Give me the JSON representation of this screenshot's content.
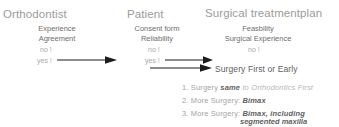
{
  "columns": [
    {
      "title": "Orthodontist",
      "criteria": "Experience\nAgreement",
      "answers": {
        "no": "no !",
        "yes": "yes !"
      }
    },
    {
      "title": "Patient",
      "criteria": "Consent form\nReliability",
      "answers": {
        "no": "no !",
        "yes": "yes !"
      }
    },
    {
      "title": "Surgical treatmentplan",
      "criteria": "Feasbility\nSurgical Experience",
      "answers": {
        "no": "no !"
      }
    }
  ],
  "outcome": "Surgery First or Early",
  "options": [
    {
      "number": "1.",
      "lead": "Surgery",
      "emphasis": "same",
      "tail": "to Orthodontics First"
    },
    {
      "number": "2.",
      "lead": "More Surgery:",
      "emphasis": "Bimax",
      "tail": ""
    },
    {
      "number": "3.",
      "lead": "More Surgery:",
      "emphasis": "Bimax, including",
      "emphasis2": "segmented maxilla",
      "tail": ""
    }
  ],
  "icons": {
    "arrow": "arrow-right-icon"
  },
  "colors": {
    "title": "#9b9b9b",
    "criteria": "#6e6e6e",
    "answer": "#a9a9a9",
    "outcome": "#5e5e5e",
    "emphasis": "#5f5f5f",
    "arrow": "#1d1d1d",
    "background": "#ffffff"
  }
}
